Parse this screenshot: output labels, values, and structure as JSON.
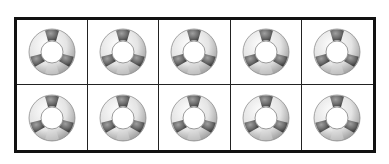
{
  "ten_frame": {
    "rows": 2,
    "columns": 5,
    "cells": [
      {
        "item": "life-ring"
      },
      {
        "item": "life-ring"
      },
      {
        "item": "life-ring"
      },
      {
        "item": "life-ring"
      },
      {
        "item": "life-ring"
      },
      {
        "item": "life-ring"
      },
      {
        "item": "life-ring"
      },
      {
        "item": "life-ring"
      },
      {
        "item": "life-ring"
      },
      {
        "item": "life-ring"
      }
    ],
    "count": 10
  },
  "colors": {
    "border": "#111111",
    "ring_light": "#f2f2f2",
    "ring_dark": "#6e6e6e"
  }
}
